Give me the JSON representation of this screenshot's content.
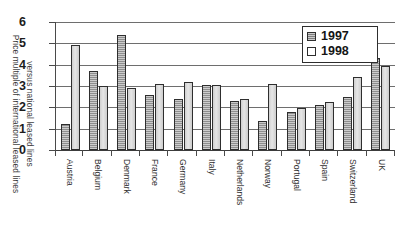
{
  "chart_data": {
    "type": "bar",
    "title": "",
    "xlabel": "",
    "ylabel": "Price multiple of international leased lines versus national leased lines",
    "ylabel_line1": "Price multiple of international leased lines",
    "ylabel_line2": "versus national leased lines",
    "ylim": [
      0,
      6
    ],
    "yticks": [
      0,
      1,
      2,
      3,
      4,
      5,
      6
    ],
    "ytick_labels": [
      "0",
      "1",
      "2",
      "3",
      "4",
      "5",
      "6"
    ],
    "grid": true,
    "grid_axis": "y",
    "legend_position": "top-right",
    "categories": [
      "Austria",
      "Belgium",
      "Denmark",
      "France",
      "Germany",
      "Italy",
      "Netherlands",
      "Norway",
      "Portugal",
      "Spain",
      "Switzerland",
      "UK"
    ],
    "series": [
      {
        "name": "1997",
        "color": "#8e8e8e",
        "values": [
          1.2,
          3.7,
          5.4,
          2.6,
          2.4,
          3.05,
          2.3,
          1.35,
          1.8,
          2.1,
          2.5,
          4.3
        ]
      },
      {
        "name": "1998",
        "color": "#d9d9d9",
        "values": [
          4.9,
          3.0,
          2.9,
          3.1,
          3.2,
          3.05,
          2.4,
          3.1,
          1.95,
          2.25,
          3.4,
          3.95
        ]
      }
    ]
  },
  "legend": {
    "items": [
      {
        "label": "1997",
        "swatch": "legend-swatch-1997"
      },
      {
        "label": "1998",
        "swatch": "legend-swatch-1998"
      }
    ]
  },
  "colors": {
    "series_1997": "#8e8e8e",
    "series_1998": "#d9d9d9",
    "axis": "#4a4a4a",
    "grid": "#6e6e6e",
    "text": "#1c1c1c",
    "background": "#ffffff"
  }
}
